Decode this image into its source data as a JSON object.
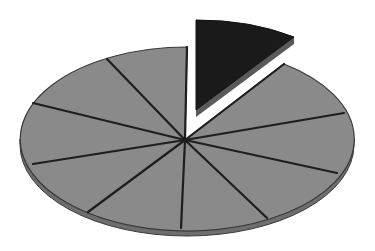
{
  "figure": {
    "slice_count": 12,
    "highlighted_slice_index": 0
  },
  "colors": {
    "background": "#ffffff",
    "slice_fill": "#8a8a8a",
    "rim_fill": "#6e6e6e",
    "spoke_stroke": "#1e1e1e",
    "highlight_fill": "#1a1a1a",
    "highlight_side": "#5a5a5a",
    "outline": "#3a3a3a"
  },
  "geometry": {
    "center": [
      185,
      139
    ],
    "rx": 165,
    "ry": 91,
    "rim_depth": 5
  }
}
